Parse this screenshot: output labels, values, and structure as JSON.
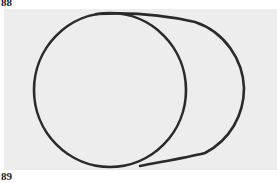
{
  "figure": {
    "top_label": "88",
    "bottom_label": "89",
    "background_color": "#ededed",
    "stroke_color": "#2a2a2a",
    "drawing": "hand-drawn circle with cylinder outline extending to the right"
  }
}
